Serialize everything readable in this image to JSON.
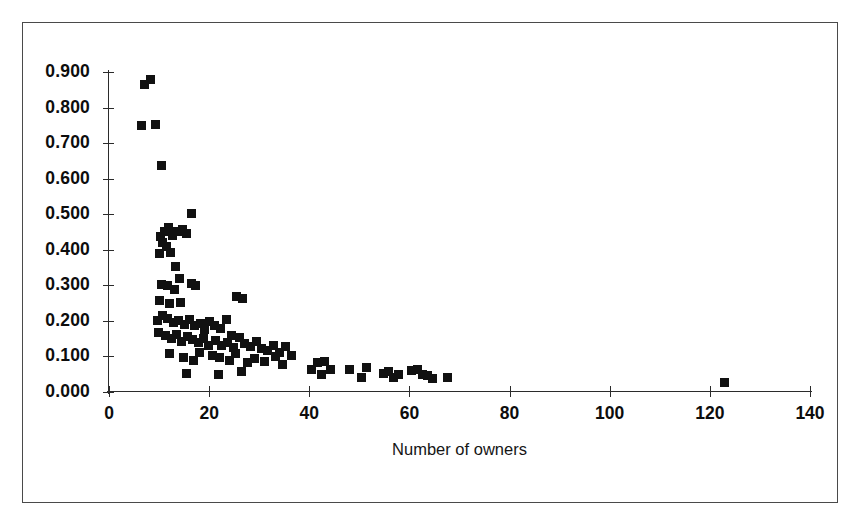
{
  "chart_data": {
    "type": "scatter",
    "title": "",
    "xlabel": "Number of owners",
    "ylabel": "",
    "xlim": [
      0,
      140
    ],
    "ylim": [
      0.0,
      0.9
    ],
    "grid": false,
    "legend": null,
    "marker": {
      "shape": "square",
      "color": "#111111",
      "size_px": 9
    },
    "xticks": [
      0,
      20,
      40,
      60,
      80,
      100,
      120,
      140
    ],
    "xtick_labels": [
      "0",
      "20",
      "40",
      "60",
      "80",
      "100",
      "120",
      "140"
    ],
    "yticks": [
      0.0,
      0.1,
      0.2,
      0.3,
      0.4,
      0.5,
      0.6,
      0.7,
      0.8,
      0.9
    ],
    "ytick_labels": [
      "0.000",
      "0.100",
      "0.200",
      "0.300",
      "0.400",
      "0.500",
      "0.600",
      "0.700",
      "0.800",
      "0.900"
    ],
    "points": [
      [
        7.0,
        0.866
      ],
      [
        8.2,
        0.88
      ],
      [
        6.4,
        0.75
      ],
      [
        9.3,
        0.752
      ],
      [
        10.4,
        0.637
      ],
      [
        16.5,
        0.503
      ],
      [
        11.0,
        0.452
      ],
      [
        11.8,
        0.462
      ],
      [
        12.6,
        0.44
      ],
      [
        13.6,
        0.452
      ],
      [
        14.6,
        0.458
      ],
      [
        15.4,
        0.446
      ],
      [
        10.2,
        0.437
      ],
      [
        10.6,
        0.42
      ],
      [
        11.4,
        0.408
      ],
      [
        10.0,
        0.39
      ],
      [
        12.2,
        0.392
      ],
      [
        13.2,
        0.352
      ],
      [
        14.0,
        0.32
      ],
      [
        10.4,
        0.302
      ],
      [
        11.6,
        0.3
      ],
      [
        13.0,
        0.288
      ],
      [
        16.4,
        0.305
      ],
      [
        17.2,
        0.3
      ],
      [
        10.0,
        0.258
      ],
      [
        12.0,
        0.248
      ],
      [
        14.2,
        0.252
      ],
      [
        25.5,
        0.268
      ],
      [
        26.6,
        0.262
      ],
      [
        9.6,
        0.2
      ],
      [
        10.6,
        0.215
      ],
      [
        11.6,
        0.208
      ],
      [
        12.8,
        0.196
      ],
      [
        13.8,
        0.2
      ],
      [
        15.0,
        0.19
      ],
      [
        16.0,
        0.205
      ],
      [
        17.0,
        0.186
      ],
      [
        18.2,
        0.192
      ],
      [
        19.0,
        0.176
      ],
      [
        20.0,
        0.198
      ],
      [
        21.0,
        0.186
      ],
      [
        22.2,
        0.178
      ],
      [
        23.4,
        0.205
      ],
      [
        24.4,
        0.16
      ],
      [
        9.8,
        0.168
      ],
      [
        11.2,
        0.158
      ],
      [
        12.4,
        0.15
      ],
      [
        13.4,
        0.162
      ],
      [
        14.4,
        0.142
      ],
      [
        15.6,
        0.156
      ],
      [
        16.6,
        0.148
      ],
      [
        17.8,
        0.138
      ],
      [
        18.8,
        0.15
      ],
      [
        19.8,
        0.132
      ],
      [
        21.2,
        0.145
      ],
      [
        22.4,
        0.13
      ],
      [
        23.6,
        0.14
      ],
      [
        24.8,
        0.126
      ],
      [
        26.0,
        0.152
      ],
      [
        27.0,
        0.136
      ],
      [
        28.2,
        0.128
      ],
      [
        29.4,
        0.142
      ],
      [
        30.4,
        0.122
      ],
      [
        31.6,
        0.118
      ],
      [
        32.8,
        0.132
      ],
      [
        34.0,
        0.112
      ],
      [
        35.2,
        0.128
      ],
      [
        36.4,
        0.104
      ],
      [
        12.0,
        0.108
      ],
      [
        14.8,
        0.098
      ],
      [
        16.8,
        0.09
      ],
      [
        18.0,
        0.112
      ],
      [
        20.6,
        0.104
      ],
      [
        22.0,
        0.096
      ],
      [
        24.0,
        0.09
      ],
      [
        25.2,
        0.108
      ],
      [
        27.6,
        0.082
      ],
      [
        29.0,
        0.094
      ],
      [
        31.0,
        0.086
      ],
      [
        33.2,
        0.1
      ],
      [
        34.6,
        0.078
      ],
      [
        15.4,
        0.052
      ],
      [
        21.8,
        0.048
      ],
      [
        26.4,
        0.058
      ],
      [
        40.4,
        0.062
      ],
      [
        41.6,
        0.082
      ],
      [
        43.0,
        0.086
      ],
      [
        44.2,
        0.062
      ],
      [
        42.4,
        0.048
      ],
      [
        48.0,
        0.062
      ],
      [
        50.4,
        0.04
      ],
      [
        51.4,
        0.07
      ],
      [
        54.8,
        0.052
      ],
      [
        55.8,
        0.058
      ],
      [
        56.8,
        0.04
      ],
      [
        57.8,
        0.048
      ],
      [
        60.4,
        0.06
      ],
      [
        61.6,
        0.062
      ],
      [
        62.6,
        0.05
      ],
      [
        63.6,
        0.046
      ],
      [
        64.6,
        0.038
      ],
      [
        67.6,
        0.04
      ],
      [
        123.0,
        0.028
      ]
    ]
  }
}
